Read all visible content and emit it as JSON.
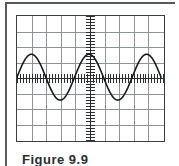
{
  "figure": {
    "caption": "Figure 9.9",
    "frame_color": "#555b5e"
  },
  "scope": {
    "screen_border_color": "#3a3f42",
    "grid_color": "#8e9396",
    "axis_color": "#2b2f31",
    "trace_color": "#161a1c",
    "background": "#ffffff"
  },
  "chart_data": {
    "type": "line",
    "title": "Figure 9.9",
    "subtitle": "",
    "xlabel": "",
    "ylabel": "",
    "grid": true,
    "legend": null,
    "horizontal_divisions": 10,
    "vertical_divisions": 8,
    "xlim": [
      -5,
      5
    ],
    "ylim": [
      -4,
      4
    ],
    "xtick_labels": [],
    "ytick_labels": [],
    "center_axis_minor_ticks_per_division": 5,
    "series": [
      {
        "name": "sine waveform",
        "waveform": "sine",
        "amplitude_divisions": 1.5,
        "period_divisions": 4,
        "cycles_visible": 2.5,
        "phase": "positive peak at center",
        "vertical_offset_divisions": 0,
        "x": [
          -5.0,
          -4.75,
          -4.5,
          -4.25,
          -4.0,
          -3.75,
          -3.5,
          -3.25,
          -3.0,
          -2.75,
          -2.5,
          -2.25,
          -2.0,
          -1.75,
          -1.5,
          -1.25,
          -1.0,
          -0.75,
          -0.5,
          -0.25,
          0.0,
          0.25,
          0.5,
          0.75,
          1.0,
          1.25,
          1.5,
          1.75,
          2.0,
          2.25,
          2.5,
          2.75,
          3.0,
          3.25,
          3.5,
          3.75,
          4.0,
          4.25,
          4.5,
          4.75,
          5.0
        ],
        "y": [
          1.06,
          1.39,
          1.5,
          1.39,
          1.06,
          0.57,
          0.0,
          -0.57,
          -1.06,
          -1.39,
          -1.5,
          -1.39,
          -1.06,
          -0.57,
          0.0,
          0.57,
          1.06,
          1.39,
          1.5,
          1.39,
          1.06,
          0.57,
          0.0,
          -0.57,
          -1.06,
          -1.39,
          -1.5,
          -1.39,
          -1.06,
          -0.57,
          0.0,
          0.57,
          1.06,
          1.39,
          1.5,
          1.39,
          1.06,
          0.57,
          0.0,
          -0.57,
          -1.06
        ]
      }
    ]
  }
}
